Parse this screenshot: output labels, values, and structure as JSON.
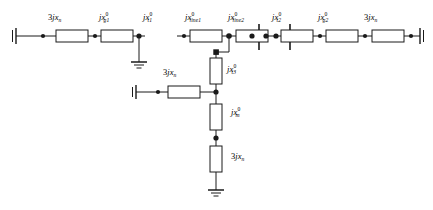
{
  "diagram": {
    "type": "electrical-one-line-impedance-network",
    "stroke_color": "#1a1a1a",
    "background_color": "#ffffff",
    "labels": {
      "gen1_neutral": {
        "coef": "3",
        "j": "j",
        "x": "x",
        "sub": "n",
        "sup": ""
      },
      "gen1": {
        "coef": "",
        "j": "j",
        "x": "x",
        "sub": "g1",
        "sup": "0"
      },
      "xfmr1": {
        "coef": "",
        "j": "j",
        "x": "x",
        "sub": "t1",
        "sup": "0"
      },
      "line1": {
        "coef": "",
        "j": "j",
        "x": "x",
        "sub": "line1",
        "sup": "0"
      },
      "line2": {
        "coef": "",
        "j": "j",
        "x": "x",
        "sub": "line2",
        "sup": "0"
      },
      "xfmr2": {
        "coef": "",
        "j": "j",
        "x": "x",
        "sub": "t2",
        "sup": "0"
      },
      "gen2": {
        "coef": "",
        "j": "j",
        "x": "x",
        "sub": "g2",
        "sup": "0"
      },
      "gen2_neutral": {
        "coef": "3",
        "j": "j",
        "x": "x",
        "sub": "n",
        "sup": ""
      },
      "xfmr3_neutral": {
        "coef": "3",
        "j": "j",
        "x": "x",
        "sub": "n",
        "sup": ""
      },
      "xfmr3": {
        "coef": "",
        "j": "j",
        "x": "x",
        "sub": "t3",
        "sup": "0"
      },
      "motor": {
        "coef": "",
        "j": "j",
        "x": "x",
        "sub": "m",
        "sup": "0"
      },
      "motor_neutral": {
        "coef": "3",
        "j": "j",
        "x": "x",
        "sub": "n",
        "sup": ""
      }
    },
    "elements": [
      {
        "name": "gen1-neutral-reactance",
        "kind": "box",
        "orientation": "horizontal"
      },
      {
        "name": "gen1-reactance",
        "kind": "box",
        "orientation": "horizontal"
      },
      {
        "name": "transformer1-reactance",
        "kind": "box",
        "orientation": "horizontal"
      },
      {
        "name": "line1-reactance",
        "kind": "box",
        "orientation": "horizontal"
      },
      {
        "name": "line2-reactance",
        "kind": "box",
        "orientation": "horizontal"
      },
      {
        "name": "transformer2-reactance",
        "kind": "box",
        "orientation": "horizontal"
      },
      {
        "name": "gen2-reactance",
        "kind": "box",
        "orientation": "horizontal"
      },
      {
        "name": "gen2-neutral-reactance",
        "kind": "box",
        "orientation": "horizontal"
      },
      {
        "name": "transformer3-neutral-reactance",
        "kind": "box",
        "orientation": "horizontal"
      },
      {
        "name": "transformer3-reactance",
        "kind": "box",
        "orientation": "vertical"
      },
      {
        "name": "motor-reactance",
        "kind": "box",
        "orientation": "vertical"
      },
      {
        "name": "motor-neutral-reactance",
        "kind": "box",
        "orientation": "vertical"
      }
    ],
    "grounds": [
      {
        "name": "transformer1-ground",
        "style": "earth-3bar"
      },
      {
        "name": "motor-neutral-ground",
        "style": "earth-3bar"
      }
    ],
    "reference_bars": [
      {
        "name": "left-reference-bus"
      },
      {
        "name": "right-reference-bus"
      },
      {
        "name": "center-reference-bus"
      },
      {
        "name": "transformer3-branch-reference-bus"
      }
    ]
  }
}
